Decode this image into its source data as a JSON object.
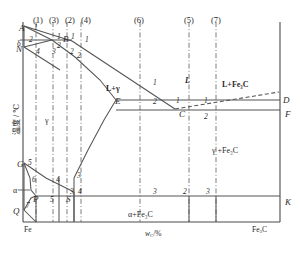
{
  "figure": {
    "type": "phase-diagram",
    "name": "Fe-Fe3C phase diagram with alloy composition lines",
    "axis": {
      "ylabel": "温度 / ℃",
      "xlabel_prefix": "w",
      "xlabel_sub": "C",
      "xlabel_suffix": "/%",
      "x_left_end": "Fe",
      "x_right_end_prefix": "Fe",
      "x_right_end_sub": "3",
      "x_right_end_suffix": "C"
    },
    "group_labels": [
      {
        "text": "(1)",
        "x": 33,
        "y": 16
      },
      {
        "text": "(3)",
        "x": 49,
        "y": 16
      },
      {
        "text": "(2)",
        "x": 65,
        "y": 16
      },
      {
        "text": "(4)",
        "x": 81,
        "y": 16
      },
      {
        "text": "(6)",
        "x": 134,
        "y": 16
      },
      {
        "text": "(5)",
        "x": 184,
        "y": 16
      },
      {
        "text": "(7)",
        "x": 211,
        "y": 16
      }
    ],
    "phase_regions": [
      {
        "text": "L",
        "x": 185,
        "y": 77,
        "style": "italic-bold"
      },
      {
        "text": "L+γ",
        "x": 106,
        "y": 85,
        "style": "bold"
      },
      {
        "text": "L+Fe₃C",
        "x": 222,
        "y": 81,
        "style": "bold"
      },
      {
        "text": "γ",
        "x": 45,
        "y": 117,
        "style": "plain"
      },
      {
        "text": "γ +Fe₃C",
        "x": 212,
        "y": 147,
        "style": "plain"
      },
      {
        "text": "α+Fe₃C",
        "x": 128,
        "y": 211,
        "style": "plain"
      },
      {
        "text": "δ",
        "x": 17,
        "y": 40,
        "style": "plain"
      },
      {
        "text": "α",
        "x": 13,
        "y": 187,
        "style": "plain"
      }
    ],
    "point_labels": [
      {
        "text": "A",
        "x": 19,
        "y": 24
      },
      {
        "text": "N",
        "x": 16,
        "y": 45
      },
      {
        "text": "B",
        "x": 63,
        "y": 35
      },
      {
        "text": "E",
        "x": 115,
        "y": 97
      },
      {
        "text": "C",
        "x": 179,
        "y": 110
      },
      {
        "text": "D",
        "x": 283,
        "y": 96
      },
      {
        "text": "F",
        "x": 285,
        "y": 110
      },
      {
        "text": "G",
        "x": 17,
        "y": 160
      },
      {
        "text": "P",
        "x": 33,
        "y": 195
      },
      {
        "text": "S",
        "x": 66,
        "y": 195
      },
      {
        "text": "Q",
        "x": 13,
        "y": 207
      },
      {
        "text": "K",
        "x": 285,
        "y": 198
      }
    ],
    "stage_numbers": [
      {
        "text": "1",
        "x": 34,
        "y": 24
      },
      {
        "text": "1",
        "x": 57,
        "y": 33
      },
      {
        "text": "1",
        "x": 71,
        "y": 33
      },
      {
        "text": "1",
        "x": 85,
        "y": 36
      },
      {
        "text": "2",
        "x": 29,
        "y": 36
      },
      {
        "text": "2",
        "x": 57,
        "y": 42
      },
      {
        "text": "2",
        "x": 77,
        "y": 52
      },
      {
        "text": "4",
        "x": 36,
        "y": 48
      },
      {
        "text": "3",
        "x": 52,
        "y": 48
      },
      {
        "text": "2",
        "x": 70,
        "y": 48
      },
      {
        "text": "1",
        "x": 153,
        "y": 79
      },
      {
        "text": "2",
        "x": 153,
        "y": 98
      },
      {
        "text": "1",
        "x": 176,
        "y": 97
      },
      {
        "text": "1",
        "x": 204,
        "y": 97
      },
      {
        "text": "2",
        "x": 204,
        "y": 113
      },
      {
        "text": "5",
        "x": 28,
        "y": 159
      },
      {
        "text": "6",
        "x": 32,
        "y": 176
      },
      {
        "text": "4",
        "x": 56,
        "y": 176
      },
      {
        "text": "3",
        "x": 77,
        "y": 172
      },
      {
        "text": "3",
        "x": 70,
        "y": 188
      },
      {
        "text": "4",
        "x": 78,
        "y": 188
      },
      {
        "text": "7",
        "x": 26,
        "y": 202
      },
      {
        "text": "5",
        "x": 50,
        "y": 196
      },
      {
        "text": "3",
        "x": 153,
        "y": 188
      },
      {
        "text": "2",
        "x": 183,
        "y": 188
      },
      {
        "text": "3",
        "x": 206,
        "y": 188
      }
    ],
    "vertical_lines": [
      {
        "x": 36,
        "y1": 22,
        "y2": 222,
        "style": "dash-dot"
      },
      {
        "x": 53,
        "y1": 22,
        "y2": 222,
        "style": "dash-dot"
      },
      {
        "x": 67,
        "y1": 22,
        "y2": 222,
        "style": "dash-dot"
      },
      {
        "x": 81,
        "y1": 22,
        "y2": 222,
        "style": "dash-dot"
      },
      {
        "x": 140,
        "y1": 22,
        "y2": 222,
        "style": "dash-dot"
      },
      {
        "x": 189,
        "y1": 22,
        "y2": 222,
        "style": "dash-dot"
      },
      {
        "x": 216,
        "y1": 22,
        "y2": 222,
        "style": "dash-dot"
      }
    ],
    "solid_verticals": [
      {
        "x": 59,
        "y1": 178,
        "y2": 222
      },
      {
        "x": 74,
        "y1": 178,
        "y2": 222
      },
      {
        "x": 189,
        "y1": 196,
        "y2": 222
      },
      {
        "x": 216,
        "y1": 196,
        "y2": 222
      },
      {
        "x": 36,
        "y1": 196,
        "y2": 222
      }
    ],
    "key_temperatures": {
      "A_liquidus_pure_Fe": 1538,
      "N_delta_gamma": 1394,
      "peritectic_HJB": 1495,
      "eutectic_ECF": 1148,
      "eutectoid_PSK": 727,
      "G_alpha_gamma": 912
    },
    "key_compositions": {
      "C_eutectic": 4.3,
      "E_max_C_in_gamma": 2.11,
      "S_eutectoid": 0.77,
      "P_max_C_in_alpha": 0.0218,
      "D_Fe3C": 6.69
    }
  }
}
